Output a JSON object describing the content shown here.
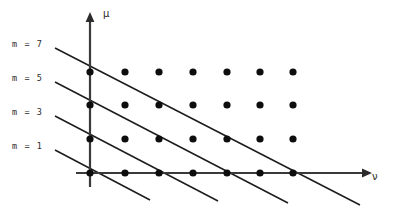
{
  "figure": {
    "background_color": "#ffffff",
    "line_color": "#1c1c1c",
    "dot_color": "#0d0d0d",
    "axis_color": "#3a3a3a"
  },
  "axes": {
    "vertical": {
      "label": "μ",
      "name": "mu-axis",
      "label_x": 103,
      "label_y": 9
    },
    "horizontal": {
      "label": "ν",
      "name": "nu-axis",
      "label_x": 372,
      "label_y": 172
    },
    "origin_x": 90,
    "origin_y": 173
  },
  "m_labels": [
    {
      "text": "m = 7",
      "x": 12,
      "y": 40
    },
    {
      "text": "m = 5",
      "x": 12,
      "y": 74
    },
    {
      "text": "m = 3",
      "x": 12,
      "y": 108
    },
    {
      "text": "m = 1",
      "x": 12,
      "y": 142
    }
  ],
  "chart_data": {
    "type": "scatter",
    "title": "",
    "xlabel": "ν",
    "ylabel": "μ",
    "grid": false,
    "legend": "none",
    "x": [
      0,
      1,
      2,
      3,
      4,
      5,
      6
    ],
    "y": [
      0,
      1,
      2,
      3
    ],
    "dot_radius": 3.6,
    "col_px": [
      90,
      125,
      159,
      193,
      227,
      260,
      293
    ],
    "row_px": [
      173,
      139,
      105,
      72
    ],
    "points": [
      {
        "nu": 0,
        "mu": 0,
        "px": 90,
        "py": 173
      },
      {
        "nu": 1,
        "mu": 0,
        "px": 125,
        "py": 173
      },
      {
        "nu": 2,
        "mu": 0,
        "px": 159,
        "py": 173
      },
      {
        "nu": 3,
        "mu": 0,
        "px": 193,
        "py": 173
      },
      {
        "nu": 4,
        "mu": 0,
        "px": 227,
        "py": 173
      },
      {
        "nu": 5,
        "mu": 0,
        "px": 260,
        "py": 173
      },
      {
        "nu": 6,
        "mu": 0,
        "px": 293,
        "py": 173
      },
      {
        "nu": 0,
        "mu": 1,
        "px": 90,
        "py": 139
      },
      {
        "nu": 1,
        "mu": 1,
        "px": 125,
        "py": 139
      },
      {
        "nu": 2,
        "mu": 1,
        "px": 159,
        "py": 139
      },
      {
        "nu": 3,
        "mu": 1,
        "px": 193,
        "py": 139
      },
      {
        "nu": 4,
        "mu": 1,
        "px": 227,
        "py": 139
      },
      {
        "nu": 5,
        "mu": 1,
        "px": 260,
        "py": 139
      },
      {
        "nu": 6,
        "mu": 1,
        "px": 293,
        "py": 139
      },
      {
        "nu": 0,
        "mu": 2,
        "px": 90,
        "py": 105
      },
      {
        "nu": 1,
        "mu": 2,
        "px": 125,
        "py": 105
      },
      {
        "nu": 2,
        "mu": 2,
        "px": 159,
        "py": 105
      },
      {
        "nu": 3,
        "mu": 2,
        "px": 193,
        "py": 105
      },
      {
        "nu": 4,
        "mu": 2,
        "px": 227,
        "py": 105
      },
      {
        "nu": 5,
        "mu": 2,
        "px": 260,
        "py": 105
      },
      {
        "nu": 6,
        "mu": 2,
        "px": 293,
        "py": 105
      },
      {
        "nu": 0,
        "mu": 3,
        "px": 90,
        "py": 72
      },
      {
        "nu": 1,
        "mu": 3,
        "px": 125,
        "py": 72
      },
      {
        "nu": 2,
        "mu": 3,
        "px": 159,
        "py": 72
      },
      {
        "nu": 3,
        "mu": 3,
        "px": 193,
        "py": 72
      },
      {
        "nu": 4,
        "mu": 3,
        "px": 227,
        "py": 72
      },
      {
        "nu": 5,
        "mu": 3,
        "px": 260,
        "py": 72
      },
      {
        "nu": 6,
        "mu": 3,
        "px": 293,
        "py": 72
      }
    ],
    "diagonals": [
      {
        "m": 7,
        "x1": 55,
        "y1": 48,
        "x2": 360,
        "y2": 205
      },
      {
        "m": 5,
        "x1": 55,
        "y1": 82,
        "x2": 288,
        "y2": 203
      },
      {
        "m": 3,
        "x1": 55,
        "y1": 116,
        "x2": 218,
        "y2": 201
      },
      {
        "m": 1,
        "x1": 55,
        "y1": 150,
        "x2": 150,
        "y2": 200
      }
    ]
  }
}
